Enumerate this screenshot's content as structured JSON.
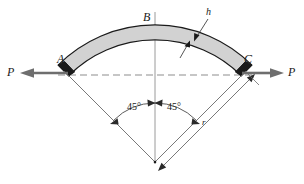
{
  "figure": {
    "name": "curved-arch-free-body-diagram",
    "colors": {
      "arch_fill": "#d2d2d2",
      "arch_stroke": "#1a1a1a",
      "end_block_fill": "#1a1a1a",
      "force_arrow": "#6e6e6e",
      "center_line": "#9a9a9a",
      "dashed_chord": "#8e8e8e",
      "dimension_line": "#6a6a6a",
      "text": "#1a1a1a",
      "background": "#ffffff"
    },
    "labels": {
      "force_left": "P",
      "force_right": "P",
      "point_a": "A",
      "point_b": "B",
      "point_c": "C",
      "thickness": "h",
      "radius": "r",
      "angle_left": "45°",
      "angle_right": "45°"
    },
    "geometry": {
      "center_x": 155,
      "center_y": 162,
      "outer_radius": 137,
      "inner_radius": 122,
      "half_angle_deg": 45,
      "point_a": [
        68,
        75
      ],
      "point_b": [
        155,
        27
      ],
      "point_c": [
        242,
        75
      ]
    }
  }
}
